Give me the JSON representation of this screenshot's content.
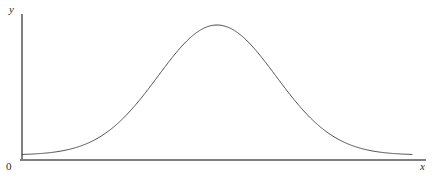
{
  "figure": {
    "background_color": "#ffffff",
    "width": 437,
    "height": 179
  },
  "labels": {
    "y_axis": "y",
    "x_axis": "x",
    "origin": "0"
  },
  "style": {
    "axis_color": "#808080",
    "curve_color": "#4d4d4d",
    "text_color": "#2b2b2b",
    "axis_width": 2,
    "curve_width": 1
  },
  "chart_data": {
    "type": "line",
    "title": "",
    "subtitle": "",
    "xlabel": "x",
    "ylabel": "y",
    "legend": [],
    "legend_position": "none",
    "grid": false,
    "annotations": [],
    "xticks": [],
    "yticks": [],
    "xticklabels": [],
    "yticklabels": [],
    "origin_label": "0",
    "curve": {
      "shape": "gaussian",
      "mean_px": 217,
      "sigma_px": 59,
      "peak_y_px": 25,
      "baseline_y_px": 155,
      "x_start_px": 22,
      "x_end_px": 412
    },
    "axes": {
      "x_axis_y_px": 160,
      "x_axis_start_px": 20,
      "x_axis_end_px": 426,
      "y_axis_x_px": 22,
      "y_axis_top_px": 14,
      "y_axis_bottom_px": 161,
      "xlim": [
        0,
        1
      ],
      "ylim": [
        0,
        1
      ]
    },
    "x": [
      0.0,
      0.05,
      0.1,
      0.15,
      0.2,
      0.25,
      0.3,
      0.35,
      0.4,
      0.45,
      0.5,
      0.55,
      0.6,
      0.65,
      0.7,
      0.75,
      0.8,
      0.85,
      0.9,
      0.95,
      1.0
    ],
    "y": [
      0.002,
      0.005,
      0.013,
      0.031,
      0.066,
      0.127,
      0.221,
      0.35,
      0.505,
      0.663,
      0.8,
      0.896,
      0.945,
      0.95,
      0.896,
      0.795,
      0.662,
      0.518,
      0.38,
      0.261,
      0.168
    ]
  }
}
